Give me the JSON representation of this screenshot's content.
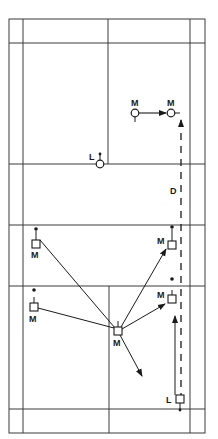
{
  "diagram": {
    "colors": {
      "line": "#3a3a3a",
      "ink": "#1a1a1a",
      "background": "#ffffff"
    },
    "court": {
      "outer": {
        "x1": 9,
        "y1": 19,
        "x2": 205,
        "y2": 433
      },
      "side_lines_x": [
        23,
        190
      ],
      "centre_line_x": 108,
      "horizontal_lines_y": [
        43,
        164,
        225,
        286,
        409
      ]
    },
    "labels": {
      "m": "M",
      "l": "L",
      "d": "D"
    },
    "players": [
      {
        "id": "m-top-start",
        "shape": "circle",
        "label": "M",
        "x": 135,
        "y": 112
      },
      {
        "id": "m-top-end",
        "shape": "circle",
        "label": "M",
        "x": 171,
        "y": 112
      },
      {
        "id": "l-top",
        "shape": "circle",
        "label": "L",
        "x": 100,
        "y": 164
      },
      {
        "id": "m-upper-left",
        "shape": "square",
        "label": "M",
        "x": 36,
        "y": 244
      },
      {
        "id": "m-lower-left",
        "shape": "square",
        "label": "M",
        "x": 34,
        "y": 307
      },
      {
        "id": "m-centre",
        "shape": "square",
        "label": "M",
        "x": 118,
        "y": 331
      },
      {
        "id": "m-upper-right",
        "shape": "square",
        "label": "M",
        "x": 172,
        "y": 245
      },
      {
        "id": "m-lower-right",
        "shape": "square",
        "label": "M",
        "x": 172,
        "y": 299
      },
      {
        "id": "l-bottom",
        "shape": "square",
        "label": "L",
        "x": 180,
        "y": 399
      }
    ],
    "dashed_path_label": "D"
  }
}
